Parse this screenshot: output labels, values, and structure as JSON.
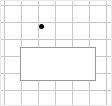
{
  "canvas": {
    "width": 112,
    "height": 106,
    "background_color": "#ffffff",
    "frame_color": "#e8e8e8"
  },
  "grid": {
    "line_color": "#c9c9c9",
    "vertical_line_x": [
      4,
      21,
      38,
      55,
      72,
      89,
      106
    ],
    "horizontal_line_y": [
      5,
      22,
      39,
      56,
      73,
      90
    ],
    "vertical_count": 7,
    "horizontal_count": 6,
    "spacing": 17
  },
  "marker": {
    "label": "point-marker",
    "color": "#000000",
    "x": 41.5,
    "y": 26.5,
    "diameter": 5.5
  },
  "rectangle": {
    "label": "selection-rectangle",
    "fill_color": "#ffffff",
    "border_color": "#9a9a9a",
    "border_width": 1.5,
    "x": 20,
    "y": 47,
    "width": 76,
    "height": 34
  }
}
